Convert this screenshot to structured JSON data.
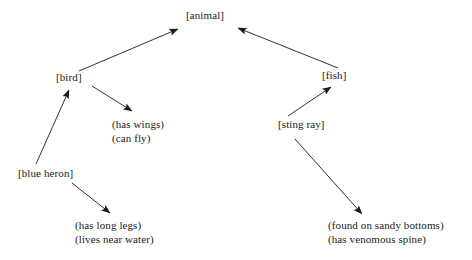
{
  "diagram": {
    "type": "semantic-network",
    "background_color": "#ffffff",
    "stroke_color": "#1a1a1a",
    "concepts": [
      {
        "id": "animal",
        "label": "[animal]",
        "x": 186,
        "y": 9
      },
      {
        "id": "bird",
        "label": "[bird]",
        "x": 56,
        "y": 71
      },
      {
        "id": "fish",
        "label": "[fish]",
        "x": 322,
        "y": 69
      },
      {
        "id": "sting_ray",
        "label": "[sting ray]",
        "x": 278,
        "y": 118
      },
      {
        "id": "blue_heron",
        "label": "[blue heron]",
        "x": 18,
        "y": 167
      }
    ],
    "attributes": [
      {
        "id": "bird_attrs",
        "x": 112,
        "y": 118,
        "lines": [
          "(has wings)",
          "(can fly)"
        ]
      },
      {
        "id": "blue_heron_attrs",
        "x": 75,
        "y": 219,
        "lines": [
          "(has long legs)",
          "(lives near water)"
        ]
      },
      {
        "id": "sting_ray_attrs",
        "x": 328,
        "y": 219,
        "lines": [
          "(found on sandy bottoms)",
          "(has venomous spine)"
        ]
      }
    ],
    "edges": [
      {
        "id": "bird-to-animal",
        "from": "bird",
        "to": "animal",
        "x1": 79,
        "y1": 71,
        "x2": 178,
        "y2": 29
      },
      {
        "id": "fish-to-animal",
        "from": "fish",
        "to": "animal",
        "x1": 338,
        "y1": 68,
        "x2": 238,
        "y2": 28
      },
      {
        "id": "blueheron-to-bird",
        "from": "blue_heron",
        "to": "bird",
        "x1": 36,
        "y1": 164,
        "x2": 69,
        "y2": 90
      },
      {
        "id": "bird-to-attrs",
        "from": "bird",
        "to": "bird_attrs",
        "x1": 92,
        "y1": 86,
        "x2": 132,
        "y2": 111
      },
      {
        "id": "stingray-to-fish",
        "from": "sting_ray",
        "to": "fish",
        "x1": 288,
        "y1": 116,
        "x2": 331,
        "y2": 87
      },
      {
        "id": "blueheron-to-attrs",
        "from": "blue_heron",
        "to": "blue_heron_attrs",
        "x1": 72,
        "y1": 183,
        "x2": 110,
        "y2": 213
      },
      {
        "id": "stingray-to-attrs",
        "from": "sting_ray",
        "to": "sting_ray_attrs",
        "x1": 295,
        "y1": 139,
        "x2": 362,
        "y2": 214
      }
    ]
  }
}
